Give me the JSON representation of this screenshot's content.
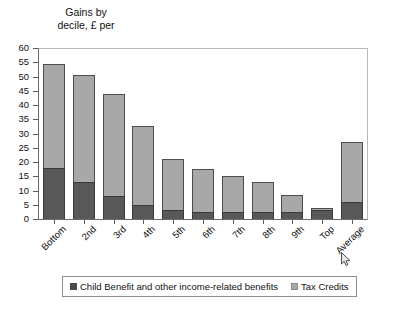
{
  "chart_data": {
    "type": "bar",
    "subtype": "stacked-vertical",
    "title": "Gains by\ndecile, £ per",
    "xlabel": "",
    "ylabel": "",
    "ylim": [
      0,
      60
    ],
    "ytick_step": 5,
    "yticks": [
      0,
      5,
      10,
      15,
      20,
      25,
      30,
      35,
      40,
      45,
      50,
      55,
      60
    ],
    "grid": false,
    "legend_position": "bottom",
    "categories": [
      "Bottom",
      "2nd",
      "3rd",
      "4th",
      "5th",
      "6th",
      "7th",
      "8th",
      "9th",
      "Top",
      "Average"
    ],
    "series": [
      {
        "name": "Child Benefit and other income-related benefits",
        "color": "#585858",
        "values": [
          18,
          13,
          8,
          5,
          3,
          2.5,
          2.5,
          2.5,
          2.5,
          3,
          6
        ]
      },
      {
        "name": "Tax Credits",
        "color": "#a8a8a8",
        "values": [
          36.5,
          37.5,
          36,
          27.5,
          18,
          15,
          12.5,
          10.5,
          6,
          1,
          21
        ]
      }
    ],
    "totals": [
      54.5,
      50.5,
      44,
      32.5,
      21,
      17.5,
      15,
      13,
      8.5,
      4,
      27
    ]
  },
  "legend": {
    "items": [
      {
        "label": "Child Benefit and other income-related benefits",
        "swatch": "dark"
      },
      {
        "label": "Tax Credits",
        "swatch": "light"
      }
    ]
  },
  "colors": {
    "series_dark": "#585858",
    "series_light": "#a8a8a8",
    "axis": "#5a5a5a",
    "frame": "#b9b9b9",
    "background": "#ffffff"
  }
}
